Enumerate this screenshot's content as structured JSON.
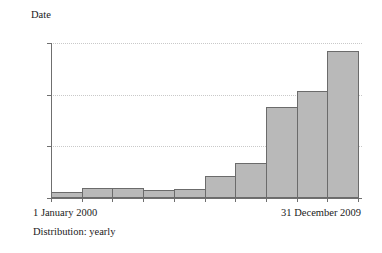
{
  "chart_data": {
    "type": "bar",
    "title": "Date",
    "xlabel": "",
    "ylabel": "",
    "ylim": [
      0,
      30000
    ],
    "grid": true,
    "legend": false,
    "categories": [
      "2000",
      "2001",
      "2002",
      "2003",
      "2004",
      "2005",
      "2006",
      "2007",
      "2008",
      "2009"
    ],
    "values": [
      1200,
      1900,
      1900,
      1500,
      1800,
      4200,
      6700,
      17700,
      20800,
      28500
    ],
    "ytick_labels": [
      "0",
      "10 000",
      "20 000",
      "30 000"
    ],
    "ytick_values": [
      0,
      10000,
      20000,
      30000
    ],
    "xtick_labels": [
      "1 January 2000",
      "31 December 2009"
    ],
    "annotations": [
      "Distribution: yearly"
    ],
    "bar_fill_color": "#b9b9b9",
    "bar_border_color": "#6b6b6b",
    "gridline_color": "#c9c9c9",
    "axis_color": "#6f6f6f"
  },
  "axis": {
    "range_start_label": "1 January 2000",
    "range_end_label": "31 December 2009"
  },
  "footer": {
    "distribution_label": "Distribution: yearly"
  }
}
